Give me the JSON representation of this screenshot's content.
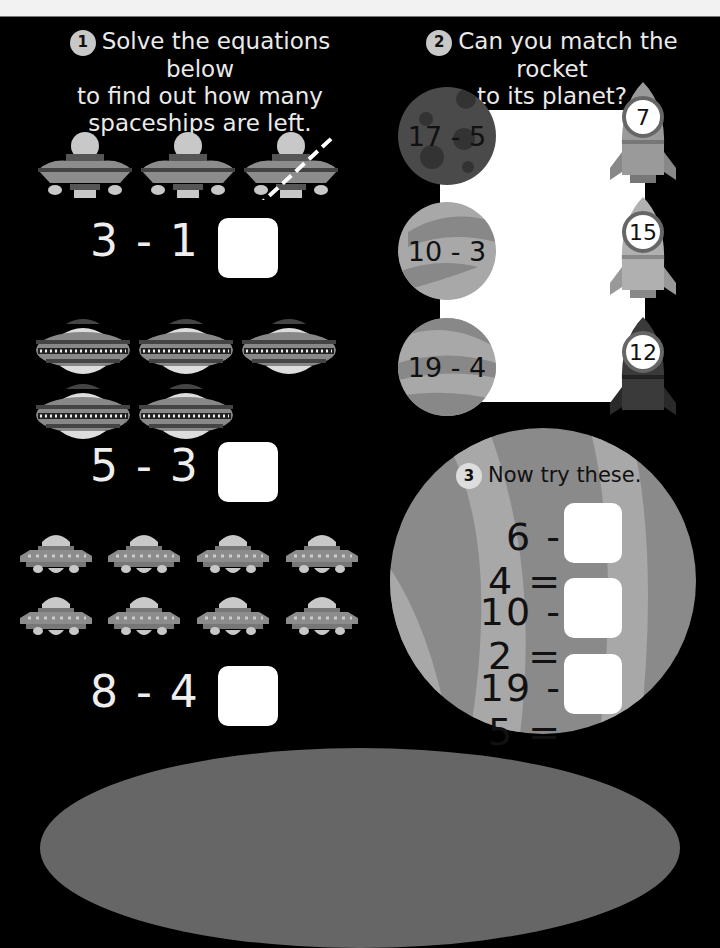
{
  "section1": {
    "badge": "1",
    "heading_lines": [
      "Solve the equations below",
      "to find out how many",
      "spaceships are left."
    ],
    "equations": [
      {
        "text": "3 - 1 =",
        "answer": ""
      },
      {
        "text": "5 - 3 =",
        "answer": ""
      },
      {
        "text": "8 - 4 =",
        "answer": ""
      }
    ]
  },
  "section2": {
    "badge": "2",
    "heading_lines": [
      "Can you match the rocket",
      "to its planet?"
    ],
    "planets": [
      {
        "label": "17 - 5"
      },
      {
        "label": "10 - 3"
      },
      {
        "label": "19 - 4"
      }
    ],
    "rockets": [
      {
        "label": "7"
      },
      {
        "label": "15"
      },
      {
        "label": "12"
      }
    ]
  },
  "section3": {
    "badge": "3",
    "heading": "Now try these.",
    "equations": [
      {
        "text": "6 - 4 =",
        "answer": ""
      },
      {
        "text": "10 - 2 =",
        "answer": ""
      },
      {
        "text": "19 - 5 =",
        "answer": ""
      }
    ]
  },
  "colors": {
    "background": "#000000",
    "ufo_body": "#8c8c8c",
    "planet_dark": "#4a4a4a",
    "planet_light": "#a8a8a8",
    "answer_box": "#ffffff"
  }
}
